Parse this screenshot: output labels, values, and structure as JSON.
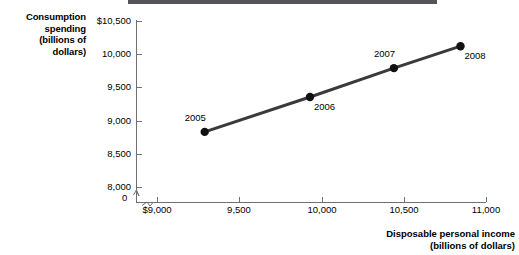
{
  "chart_data": {
    "type": "scatter",
    "title": "",
    "subtitle": "",
    "xlabel": "Disposable personal income",
    "xlabel_units": "(billions of dollars)",
    "ylabel": "Consumption spending",
    "ylabel_units_line1": "(billions of",
    "ylabel_units_line2": "dollars)",
    "ylabel_line1": "Consumption",
    "ylabel_line2": "spending",
    "xlim": [
      9000,
      11000
    ],
    "ylim": [
      8000,
      10500
    ],
    "xticks": [
      9000,
      9500,
      10000,
      10500,
      11000
    ],
    "yticks": [
      8000,
      8500,
      9000,
      9500,
      10000,
      10500
    ],
    "xtick_labels": [
      "$9,000",
      "9,500",
      "10,000",
      "10,500",
      "11,000"
    ],
    "ytick_labels": [
      "8,000",
      "8,500",
      "9,000",
      "9,500",
      "10,000",
      "$10,500"
    ],
    "origin_label": "0",
    "axis_break_x": true,
    "axis_break_y": true,
    "grid": false,
    "legend": false,
    "line_color": "#3a3a3c",
    "marker_color": "#111113",
    "axis_color": "#6f7073",
    "points": [
      {
        "label": "2005",
        "x": 9290,
        "y": 8830,
        "label_pos": "above-left"
      },
      {
        "label": "2006",
        "x": 9930,
        "y": 9355,
        "label_pos": "below-right"
      },
      {
        "label": "2007",
        "x": 10440,
        "y": 9790,
        "label_pos": "above-left"
      },
      {
        "label": "2008",
        "x": 10845,
        "y": 10120,
        "label_pos": "below-right"
      }
    ],
    "series": [
      {
        "name": "Consumption function",
        "x": [
          9290,
          9930,
          10440,
          10845
        ],
        "values": [
          8830,
          9355,
          9790,
          10120
        ]
      }
    ]
  },
  "axis_titles": {
    "y_lines": [
      "Consumption",
      "spending",
      "(billions of",
      "dollars)"
    ],
    "x_lines": [
      "Disposable personal income",
      "(billions of dollars)"
    ]
  }
}
